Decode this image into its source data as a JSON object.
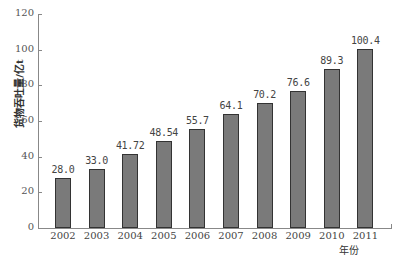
{
  "chart_data": {
    "type": "bar",
    "title": "",
    "xlabel": "年份",
    "ylabel": "货物吞吐量/亿t",
    "categories": [
      "2002",
      "2003",
      "2004",
      "2005",
      "2006",
      "2007",
      "2008",
      "2009",
      "2010",
      "2011"
    ],
    "values": [
      28.0,
      33.0,
      41.72,
      48.54,
      55.7,
      64.1,
      70.2,
      76.6,
      89.3,
      100.4
    ],
    "value_labels": [
      "28.0",
      "33.0",
      "41.72",
      "48.54",
      "55.7",
      "64.1",
      "70.2",
      "76.6",
      "89.3",
      "100.4"
    ],
    "ylim": [
      0,
      120
    ],
    "yticks": [
      0,
      20,
      40,
      60,
      80,
      100,
      120
    ],
    "grid": false,
    "legend": null,
    "bar_color": "#7a7a7a"
  }
}
